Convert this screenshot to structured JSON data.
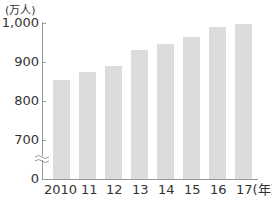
{
  "chart_data": {
    "type": "bar",
    "title": "",
    "unit_label": "(万人)",
    "xlabel": "",
    "ylabel": "(万人)",
    "categories": [
      "2010",
      "11",
      "12",
      "13",
      "14",
      "15",
      "16",
      "17(年)"
    ],
    "values": [
      854,
      874,
      890,
      931,
      946,
      964,
      990,
      997
    ],
    "yticks": [
      "0",
      "700",
      "800",
      "900",
      "1,000"
    ],
    "ylim": [
      700,
      1000
    ],
    "axis_break": true,
    "grid": false,
    "legend": null,
    "bar_color": "#dcdcdc"
  }
}
